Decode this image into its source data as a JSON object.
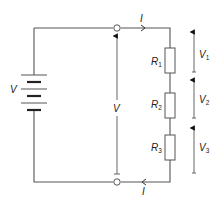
{
  "diagram": {
    "type": "series circuit",
    "source": {
      "label": "V"
    },
    "terminal_voltage": {
      "label": "V"
    },
    "current": {
      "top_label": "I",
      "bottom_label": "I"
    },
    "resistors": [
      {
        "symbol": "R",
        "sub": "1",
        "voltage_symbol": "V",
        "voltage_sub": "1"
      },
      {
        "symbol": "R",
        "sub": "2",
        "voltage_symbol": "V",
        "voltage_sub": "2"
      },
      {
        "symbol": "R",
        "sub": "3",
        "voltage_symbol": "V",
        "voltage_sub": "3"
      }
    ],
    "colors": {
      "wire": "#555555",
      "text": "#222222"
    }
  }
}
